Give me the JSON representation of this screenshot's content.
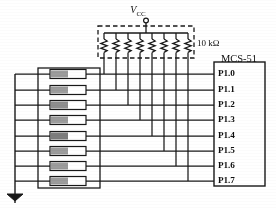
{
  "figure": {
    "power_label": "V",
    "power_sub": "CC",
    "resistor_value": "10 kΩ",
    "chip_label": "MCS-51",
    "ground_symbol": "ground-symbol"
  },
  "colors": {
    "wire": "#1a1a1a",
    "dashed_box": "#1a1a1a",
    "switch_body_fill": "#ffffff",
    "switch_shade_fill": "#9b9b9b",
    "switch_shade_fill_dark": "#7d7d7d",
    "background": "#ffffff",
    "text": "#111111"
  },
  "pins": [
    {
      "name": "P1.0",
      "index": 0
    },
    {
      "name": "P1.1",
      "index": 1
    },
    {
      "name": "P1.2",
      "index": 2
    },
    {
      "name": "P1.3",
      "index": 3
    },
    {
      "name": "P1.4",
      "index": 4
    },
    {
      "name": "P1.5",
      "index": 5
    },
    {
      "name": "P1.6",
      "index": 6
    },
    {
      "name": "P1.7",
      "index": 7
    }
  ],
  "switches": [
    {
      "id": "SW0",
      "connects_to": "P1.0"
    },
    {
      "id": "SW1",
      "connects_to": "P1.1"
    },
    {
      "id": "SW2",
      "connects_to": "P1.2"
    },
    {
      "id": "SW3",
      "connects_to": "P1.3"
    },
    {
      "id": "SW4",
      "connects_to": "P1.4"
    },
    {
      "id": "SW5",
      "connects_to": "P1.5"
    },
    {
      "id": "SW6",
      "connects_to": "P1.6"
    },
    {
      "id": "SW7",
      "connects_to": "P1.7"
    }
  ],
  "resistors": [
    {
      "id": "R0",
      "value": "10 kΩ",
      "connects_to": "P1.0"
    },
    {
      "id": "R1",
      "value": "10 kΩ",
      "connects_to": "P1.1"
    },
    {
      "id": "R2",
      "value": "10 kΩ",
      "connects_to": "P1.2"
    },
    {
      "id": "R3",
      "value": "10 kΩ",
      "connects_to": "P1.3"
    },
    {
      "id": "R4",
      "value": "10 kΩ",
      "connects_to": "P1.4"
    },
    {
      "id": "R5",
      "value": "10 kΩ",
      "connects_to": "P1.5"
    },
    {
      "id": "R6",
      "value": "10 kΩ",
      "connects_to": "P1.6"
    },
    {
      "id": "R7",
      "value": "10 kΩ",
      "connects_to": "P1.7"
    }
  ]
}
